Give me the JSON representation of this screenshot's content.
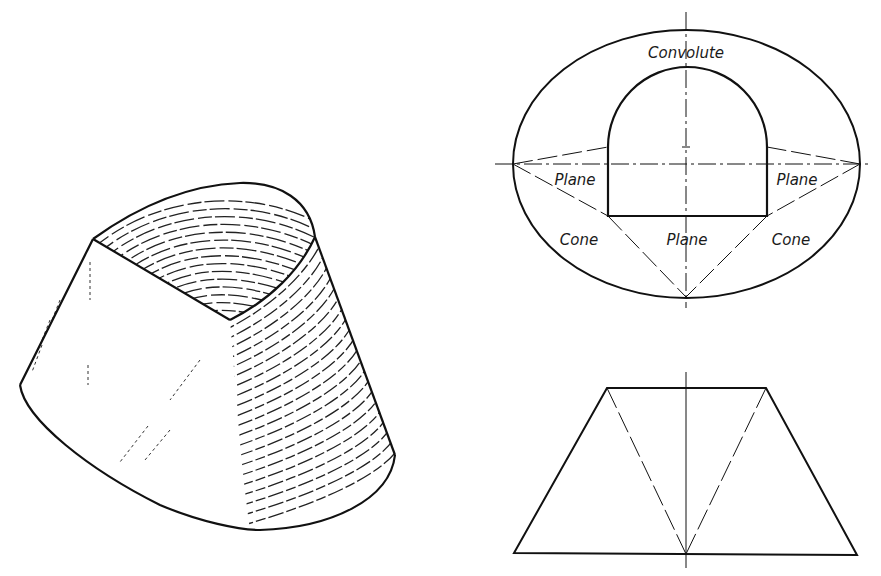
{
  "figure": {
    "type": "technical drawing",
    "views": {
      "pictorial": {
        "name": "convolute transition piece (pictorial)"
      },
      "top_view": {
        "labels": {
          "convolute": "Convolute",
          "plane_left": "Plane",
          "plane_right": "Plane",
          "plane_bottom": "Plane",
          "cone_left": "Cone",
          "cone_right": "Cone"
        }
      },
      "front_view": {
        "name": "front view (trapezoid)"
      }
    },
    "colors": {
      "ink": "#111111",
      "background": "#ffffff"
    }
  }
}
